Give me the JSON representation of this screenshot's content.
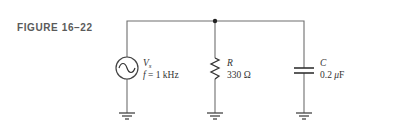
{
  "figure": {
    "label": "FIGURE 16–22"
  },
  "components": {
    "source": {
      "symbol": "V",
      "subscript": "s",
      "freq_var": "f",
      "freq_value": " = 1 kHz"
    },
    "resistor": {
      "symbol": "R",
      "value": "330 Ω"
    },
    "capacitor": {
      "symbol": "C",
      "value_num": "0.2 ",
      "value_unit_prefix": "μ",
      "value_unit": "F"
    }
  },
  "colors": {
    "wire": "#6e6e6e",
    "node": "#222222",
    "text": "#333333"
  }
}
